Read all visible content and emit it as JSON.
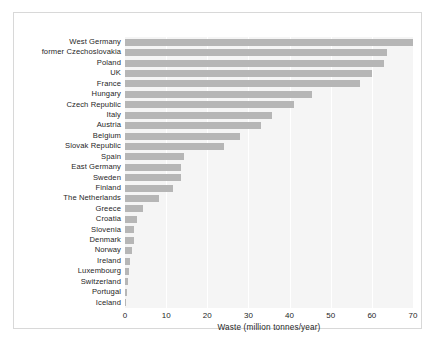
{
  "chart_data": {
    "type": "bar",
    "orientation": "horizontal",
    "title": "",
    "xlabel": "Waste (million tonnes/year)",
    "ylabel": "",
    "xlim": [
      0,
      70
    ],
    "xticks": [
      0,
      10,
      20,
      30,
      40,
      50,
      60,
      70
    ],
    "grid": "vertical-white-gridlines",
    "legend": "none",
    "bar_color": "#b6b6b6",
    "plot_background": "#f5f5f5",
    "figure_background": "#ffffff",
    "frame_color": "#d8d8d8",
    "categories": [
      "West Germany",
      "former Czechoslovakia",
      "Poland",
      "UK",
      "France",
      "Hungary",
      "Czech Republic",
      "Italy",
      "Austria",
      "Belgium",
      "Slovak Republic",
      "Spain",
      "East Germany",
      "Sweden",
      "Finland",
      "The Netherlands",
      "Greece",
      "Croatia",
      "Slovenia",
      "Denmark",
      "Norway",
      "Ireland",
      "Luxembourg",
      "Switzerland",
      "Portugal",
      "Iceland"
    ],
    "values": [
      71.0,
      63.7,
      63.0,
      60.0,
      57.0,
      45.5,
      41.0,
      35.8,
      33.0,
      28.0,
      24.0,
      14.3,
      13.6,
      13.6,
      11.7,
      8.3,
      4.3,
      3.0,
      2.2,
      2.2,
      1.8,
      1.2,
      1.0,
      0.7,
      0.5,
      0.1
    ]
  }
}
